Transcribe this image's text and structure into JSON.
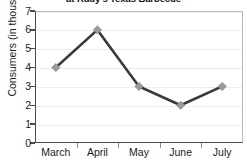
{
  "chart_data": {
    "type": "line",
    "title": "at Rudy's Texas Barbecue",
    "title_visible_fragment": "at Rudy's Texas Barbecue",
    "xlabel": "",
    "ylabel": "Consumers (in thousands)",
    "categories": [
      "March",
      "April",
      "May",
      "June",
      "July"
    ],
    "values": [
      4,
      6,
      3,
      2,
      3
    ],
    "series": [
      {
        "name": "Consumers",
        "values": [
          4,
          6,
          3,
          2,
          3
        ]
      }
    ],
    "ylim": [
      0,
      7
    ],
    "ytick_labels": [
      "0",
      "1",
      "2",
      "3",
      "4",
      "5",
      "6",
      "7"
    ],
    "ytick_values": [
      0,
      1,
      2,
      3,
      4,
      5,
      6,
      7
    ],
    "grid": true,
    "grid_axis": "y",
    "legend": false,
    "legend_position": "none",
    "marker": "diamond",
    "colors": {
      "line": "#3a3a3a",
      "marker_fill": "#9a9a9a",
      "marker_edge": "#8a8a8a",
      "gridline": "#ededed",
      "axis": "#4a4a4a",
      "plot_border": "#b9b9b9",
      "background": "#ffffff",
      "text": "#1a1a1a"
    },
    "points": [
      {
        "category": "March",
        "value": 4
      },
      {
        "category": "April",
        "value": 6
      },
      {
        "category": "May",
        "value": 3
      },
      {
        "category": "June",
        "value": 2
      },
      {
        "category": "July",
        "value": 3
      }
    ]
  }
}
